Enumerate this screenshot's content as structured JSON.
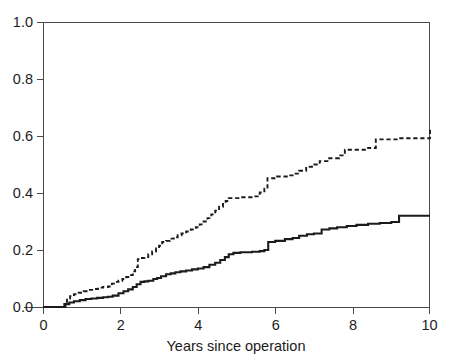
{
  "chart_data": {
    "type": "line",
    "title": "",
    "subtitle": "",
    "xlabel": "Years since operation",
    "ylabel": "",
    "xlim": [
      0,
      10
    ],
    "ylim": [
      0.0,
      1.0
    ],
    "xticks": [
      0,
      2,
      4,
      6,
      8,
      10
    ],
    "xtick_labels": [
      "0",
      "2",
      "4",
      "6",
      "8",
      "10"
    ],
    "yticks": [
      0.0,
      0.2,
      0.4,
      0.6,
      0.8,
      1.0
    ],
    "ytick_labels": [
      "0.0",
      "0.2",
      "0.4",
      "0.6",
      "0.8",
      "1.0"
    ],
    "grid": false,
    "legend": "none",
    "step_style": "post",
    "annotations": [],
    "series": [
      {
        "name": "upper-dashed-curve",
        "style": "dashed",
        "color": "#1b1b1b",
        "final_value": 0.63,
        "x": [
          0.0,
          0.52,
          0.55,
          0.62,
          0.7,
          0.8,
          0.92,
          1.05,
          1.18,
          1.3,
          1.42,
          1.55,
          1.68,
          1.78,
          1.86,
          1.95,
          2.05,
          2.15,
          2.25,
          2.32,
          2.38,
          2.45,
          2.52,
          2.62,
          2.72,
          2.82,
          2.92,
          3.0,
          3.08,
          3.18,
          3.28,
          3.38,
          3.48,
          3.58,
          3.7,
          3.82,
          3.95,
          4.05,
          4.15,
          4.25,
          4.35,
          4.45,
          4.55,
          4.65,
          4.72,
          4.8,
          5.1,
          5.45,
          5.6,
          5.72,
          5.8,
          6.05,
          6.3,
          6.45,
          6.62,
          6.8,
          6.95,
          7.15,
          7.35,
          7.65,
          7.8,
          8.4,
          8.6,
          9.2,
          10.0
        ],
        "y": [
          0.0,
          0.0,
          0.018,
          0.03,
          0.038,
          0.045,
          0.05,
          0.055,
          0.06,
          0.063,
          0.068,
          0.07,
          0.072,
          0.082,
          0.088,
          0.092,
          0.098,
          0.105,
          0.112,
          0.125,
          0.14,
          0.168,
          0.172,
          0.175,
          0.185,
          0.195,
          0.205,
          0.215,
          0.228,
          0.232,
          0.24,
          0.245,
          0.252,
          0.258,
          0.265,
          0.272,
          0.28,
          0.29,
          0.3,
          0.312,
          0.325,
          0.338,
          0.352,
          0.362,
          0.372,
          0.382,
          0.385,
          0.388,
          0.402,
          0.415,
          0.452,
          0.458,
          0.462,
          0.468,
          0.478,
          0.492,
          0.5,
          0.512,
          0.522,
          0.532,
          0.552,
          0.558,
          0.588,
          0.592,
          0.63
        ]
      },
      {
        "name": "lower-solid-curve",
        "style": "solid",
        "color": "#1b1b1b",
        "final_value": 0.32,
        "x": [
          0.0,
          0.52,
          0.58,
          0.68,
          0.8,
          0.95,
          1.1,
          1.25,
          1.4,
          1.55,
          1.68,
          1.8,
          1.95,
          2.08,
          2.2,
          2.32,
          2.42,
          2.52,
          2.62,
          2.72,
          2.85,
          2.95,
          3.05,
          3.18,
          3.3,
          3.42,
          3.55,
          3.7,
          3.85,
          4.0,
          4.15,
          4.3,
          4.45,
          4.58,
          4.7,
          4.8,
          4.92,
          5.1,
          5.4,
          5.6,
          5.72,
          5.82,
          6.0,
          6.25,
          6.45,
          6.62,
          6.82,
          7.0,
          7.2,
          7.4,
          7.6,
          7.85,
          8.1,
          8.4,
          8.7,
          9.0,
          9.2,
          10.0
        ],
        "y": [
          0.0,
          0.0,
          0.01,
          0.016,
          0.02,
          0.024,
          0.028,
          0.03,
          0.032,
          0.034,
          0.036,
          0.04,
          0.048,
          0.055,
          0.062,
          0.07,
          0.08,
          0.088,
          0.09,
          0.092,
          0.098,
          0.102,
          0.108,
          0.115,
          0.118,
          0.122,
          0.125,
          0.128,
          0.132,
          0.135,
          0.14,
          0.148,
          0.155,
          0.165,
          0.175,
          0.185,
          0.19,
          0.192,
          0.194,
          0.196,
          0.2,
          0.228,
          0.232,
          0.238,
          0.242,
          0.25,
          0.255,
          0.258,
          0.272,
          0.276,
          0.28,
          0.284,
          0.288,
          0.292,
          0.295,
          0.298,
          0.32,
          0.32
        ]
      }
    ]
  },
  "geometry": {
    "plot_left": 43,
    "plot_right": 430,
    "plot_top": 22,
    "plot_bottom": 307
  }
}
